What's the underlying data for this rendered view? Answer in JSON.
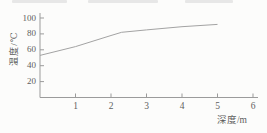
{
  "figure": {
    "background": "#fcfcfb",
    "axis_color": "#9b9b9b",
    "text_color": "#5c5c5c"
  },
  "chart_data": {
    "type": "line",
    "title": "",
    "xlabel": "深度/m",
    "ylabel": "温度/℃",
    "x": [
      0,
      1,
      2,
      2.3,
      3,
      4,
      5
    ],
    "y": [
      53,
      64,
      78,
      82,
      85,
      89,
      92
    ],
    "xticks": [
      1,
      2,
      3,
      4,
      5,
      6
    ],
    "yticks": [
      20,
      40,
      60,
      80,
      100
    ],
    "xlim": [
      0,
      6.15
    ],
    "ylim": [
      0,
      106
    ],
    "grid": false,
    "legend": null,
    "line_color": "#a3a3a3",
    "series_name": "温度随深度变化曲线"
  }
}
